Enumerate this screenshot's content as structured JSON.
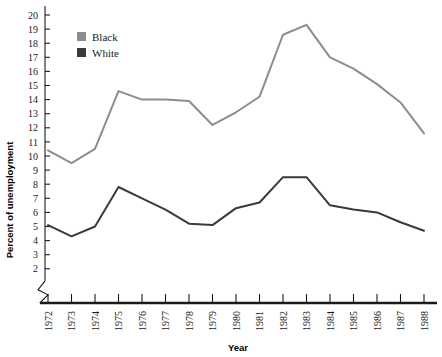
{
  "chart_data": {
    "type": "line",
    "title": "",
    "xlabel": "Year",
    "ylabel": "Percent of unemployment",
    "categories": [
      1972,
      1973,
      1974,
      1975,
      1976,
      1977,
      1978,
      1979,
      1980,
      1981,
      1982,
      1983,
      1984,
      1985,
      1986,
      1987,
      1988
    ],
    "x": [
      "1972",
      "1973",
      "1974",
      "1975",
      "1976",
      "1977",
      "1978",
      "1979",
      "1980",
      "1981",
      "1982",
      "1983",
      "1984",
      "1985",
      "1986",
      "1987",
      "1988"
    ],
    "xlim": [
      1972,
      1988
    ],
    "ylim": [
      2,
      20
    ],
    "yticks": [
      2,
      3,
      4,
      5,
      6,
      7,
      8,
      9,
      10,
      11,
      12,
      13,
      14,
      15,
      16,
      17,
      18,
      19,
      20
    ],
    "ytick_labels": [
      "2",
      "3",
      "4",
      "5",
      "6",
      "7",
      "8",
      "9",
      "10",
      "11",
      "12",
      "13",
      "14",
      "15",
      "16",
      "17",
      "18",
      "19",
      "20"
    ],
    "y_axis_break": true,
    "grid": false,
    "legend_position": "upper-left-inside",
    "series": [
      {
        "name": "Black",
        "color": "#8d8d8d",
        "values": [
          10.4,
          9.5,
          10.5,
          14.6,
          14.0,
          14.0,
          13.9,
          12.2,
          13.1,
          14.2,
          18.6,
          19.3,
          17.0,
          16.2,
          15.1,
          13.8,
          11.6
        ]
      },
      {
        "name": "White",
        "color": "#3a3a3a",
        "values": [
          5.1,
          4.3,
          5.0,
          7.8,
          7.0,
          6.2,
          5.2,
          5.1,
          6.3,
          6.7,
          8.5,
          8.5,
          6.5,
          6.2,
          6.0,
          5.3,
          4.7
        ]
      }
    ]
  },
  "legend": {
    "items": [
      {
        "label": "Black",
        "color": "#8d8d8d"
      },
      {
        "label": "White",
        "color": "#3a3a3a"
      }
    ]
  },
  "axes": {
    "y_title": "Percent of unemployment",
    "x_title": "Year"
  }
}
